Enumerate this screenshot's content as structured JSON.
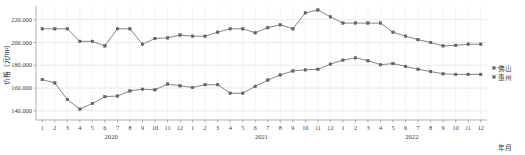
{
  "chart_data": {
    "type": "line",
    "title": "",
    "xlabel": "年月",
    "ylabel": "价格（元/m²）",
    "ylim": [
      132000,
      232000
    ],
    "yticks": [
      140000,
      160000,
      180000,
      200000,
      220000
    ],
    "ytick_labels": [
      "140.000",
      "160.000",
      "180.000",
      "200.000",
      "220.000"
    ],
    "grid": true,
    "legend_position": "right",
    "x_group_labels": [
      "2020",
      "2021",
      "2022"
    ],
    "categories": [
      "1",
      "2",
      "3",
      "4",
      "5",
      "6",
      "7",
      "8",
      "9",
      "10",
      "11",
      "12",
      "1",
      "2",
      "3",
      "4",
      "5",
      "6",
      "7",
      "8",
      "9",
      "10",
      "11",
      "12",
      "1",
      "2",
      "3",
      "4",
      "5",
      "6",
      "7",
      "8",
      "9",
      "10",
      "11",
      "12"
    ],
    "series": [
      {
        "name": "佛山",
        "values": [
          212000,
          212000,
          212000,
          201000,
          201000,
          197000,
          212000,
          212000,
          198500,
          203500,
          204000,
          206500,
          205500,
          205500,
          209000,
          212000,
          212000,
          208500,
          213000,
          215500,
          212000,
          226000,
          228500,
          222500,
          217000,
          217000,
          217000,
          217000,
          209000,
          205500,
          202500,
          200000,
          197000,
          197500,
          198500,
          198500
        ]
      },
      {
        "name": "惠州",
        "values": [
          167500,
          164500,
          150000,
          141500,
          146500,
          152500,
          153000,
          157500,
          159000,
          158500,
          163500,
          162000,
          160500,
          163000,
          163000,
          155500,
          155500,
          161500,
          167000,
          171500,
          175000,
          176000,
          176500,
          181000,
          184500,
          186500,
          184000,
          180500,
          181500,
          179000,
          176500,
          174500,
          172500,
          172000,
          172000,
          172000
        ]
      }
    ],
    "legend": [
      "佛山",
      "惠州"
    ]
  }
}
